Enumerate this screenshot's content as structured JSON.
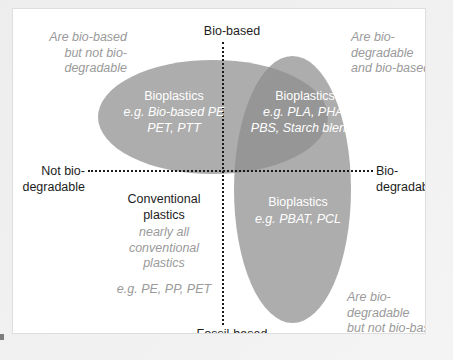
{
  "figure": {
    "type": "quadrant-venn-diagram",
    "axes": {
      "top_label": "Bio-based",
      "bottom_label": "Fossil-based",
      "left_label": "Not bio-\ndegradable",
      "right_label": "Bio-\ndegradable"
    },
    "quadrant_notes": {
      "top_left": "Are bio-based\nbut not bio-\ndegradable",
      "top_right": "Are bio-\ndegradable\nand bio-based",
      "bottom_right": "Are bio-\ndegradable\nbut not bio-based"
    },
    "groups": [
      {
        "id": "bioplastics-biobased-not-biodegradable",
        "title": "Bioplastics",
        "examples": "e.g. Bio-based PE\nPET, PTT",
        "shape": "ellipse-horizontal"
      },
      {
        "id": "bioplastics-biobased-and-biodegradable",
        "title": "Bioplastics",
        "examples": "e.g. PLA, PHA,\nPBS, Starch blends",
        "shape": "ellipse-overlap"
      },
      {
        "id": "bioplastics-fossil-based-biodegradable",
        "title": "Bioplastics",
        "examples": "e.g. PBAT, PCL",
        "shape": "ellipse-vertical"
      },
      {
        "id": "conventional-plastics",
        "title": "Conventional\nplastics",
        "note": "nearly all\nconventional\nplastics",
        "examples": "e.g. PE, PP, PET",
        "shape": "none"
      }
    ],
    "colors": {
      "ellipse_fill": "#8d8d8d",
      "overlap_fill": "#6f6f6f",
      "axis_line": "#1a1a1a",
      "note_text": "#9a9a9a",
      "label_text": "#1d1d1d",
      "inner_text": "#ffffff",
      "panel_background": "#ffffff",
      "page_background": "#f0f0f0"
    }
  }
}
